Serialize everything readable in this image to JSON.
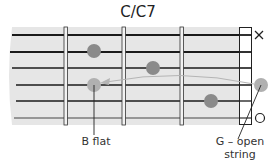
{
  "title": "C/C7",
  "diagram": {
    "type": "guitar-chord-fretboard",
    "strings": 6,
    "frets_shown": 3,
    "markers": {
      "string_1": "X",
      "string_6": "O"
    },
    "fingered_notes": [
      {
        "string": 2,
        "fret": 3,
        "style": "dark"
      },
      {
        "string": 3,
        "fret": 2,
        "style": "dark"
      },
      {
        "string": 4,
        "fret": 3,
        "style": "light",
        "note": "B flat"
      },
      {
        "string": 5,
        "fret": 1,
        "style": "dark"
      }
    ],
    "open_note": {
      "string": 4,
      "label": "G – open string"
    },
    "arrow": "from open G string to B flat at fret 3"
  },
  "labels": {
    "b_flat": "B flat",
    "g_open_line1": "G – open",
    "g_open_line2": "string",
    "x_marker": "×",
    "o_marker": "O"
  },
  "colors": {
    "fretboard": "#e6e6e6",
    "dark_dot": "#8a8a8a",
    "light_dot": "#b0b0b0",
    "string": "#1a1a1a"
  }
}
